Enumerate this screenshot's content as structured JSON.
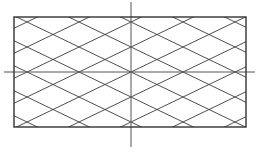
{
  "diagram": {
    "type": "diamond-lattice",
    "canvas": {
      "width": 260,
      "height": 155,
      "background": "#ffffff"
    },
    "rectangle": {
      "x1": 14,
      "y1": 17,
      "x2": 246,
      "y2": 127,
      "stroke": "#333333",
      "stroke_width": 1.4
    },
    "axes": {
      "center": {
        "x": 131,
        "y": 72
      },
      "horizontal": {
        "x1": 4,
        "x2": 255,
        "y": 72
      },
      "vertical": {
        "x": 131,
        "y1": 2,
        "y2": 147
      },
      "stroke": "#555555",
      "stroke_width": 1
    },
    "lattice": {
      "origin": {
        "x": 131,
        "y": 72
      },
      "cell_width": 52,
      "cell_height": 25,
      "slope": 0.4808,
      "line_offsets_y": [
        -150,
        -125,
        -100,
        -75,
        -50,
        -25,
        0,
        25,
        50,
        75,
        100,
        125,
        150
      ],
      "stroke": "#3a3a3a",
      "stroke_width": 0.9
    }
  }
}
